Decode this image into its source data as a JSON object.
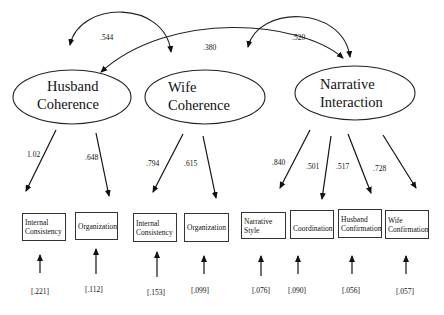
{
  "latents": [
    {
      "id": "husband-coherence",
      "label_line1": "Husband",
      "label_line2": "Coherence"
    },
    {
      "id": "wife-coherence",
      "label_line1": "Wife",
      "label_line2": "Coherence"
    },
    {
      "id": "narrative-interaction",
      "label_line1": "Narrative",
      "label_line2": "Interaction"
    }
  ],
  "correlations": [
    {
      "from": "Husband Coherence",
      "to": "Wife Coherence",
      "value": ".544"
    },
    {
      "from": "Husband Coherence",
      "to": "Narrative Interaction",
      "value": ".380"
    },
    {
      "from": "Wife Coherence",
      "to": "Narrative Interaction",
      "value": ".520"
    }
  ],
  "indicators": [
    {
      "latent": "Husband Coherence",
      "label": "Internal\nConsistency",
      "loading": "1.02",
      "error": "[.221]"
    },
    {
      "latent": "Husband Coherence",
      "label": "Organization",
      "loading": ".648",
      "error": "[.112]"
    },
    {
      "latent": "Wife Coherence",
      "label": "Internal\nConsistency",
      "loading": ".794",
      "error": "[.153]"
    },
    {
      "latent": "Wife Coherence",
      "label": "Organization",
      "loading": ".615",
      "error": "[.099]"
    },
    {
      "latent": "Narrative Interaction",
      "label": "Narrative\nStyle",
      "loading": ".840",
      "error": "[.076]"
    },
    {
      "latent": "Narrative Interaction",
      "label": "Coordination",
      "loading": ".501",
      "error": "[.090]"
    },
    {
      "latent": "Narrative Interaction",
      "label": "Husband\nConfirmation",
      "loading": ".517",
      "error": "[.056]"
    },
    {
      "latent": "Narrative Interaction",
      "label": "Wife\nConfirmation",
      "loading": ".728",
      "error": "[.057]"
    }
  ]
}
